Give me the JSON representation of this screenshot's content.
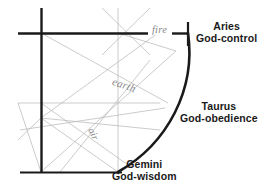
{
  "diagram": {
    "title_present": false,
    "background_color": "#ffffff",
    "stroke_dark": "#1a1a1a",
    "stroke_light": "#b5b5b5",
    "text_dark": "#1a1a1a",
    "text_gray": "#8a8a8a",
    "zodiac_labels": [
      {
        "sign": "Aries",
        "virtue": "God-control"
      },
      {
        "sign": "Taurus",
        "virtue": "God-obedience"
      },
      {
        "sign": "Gemini",
        "virtue": "God-wisdom"
      }
    ],
    "element_labels": [
      {
        "name": "fire"
      },
      {
        "name": "earth"
      },
      {
        "name": "air"
      }
    ]
  }
}
